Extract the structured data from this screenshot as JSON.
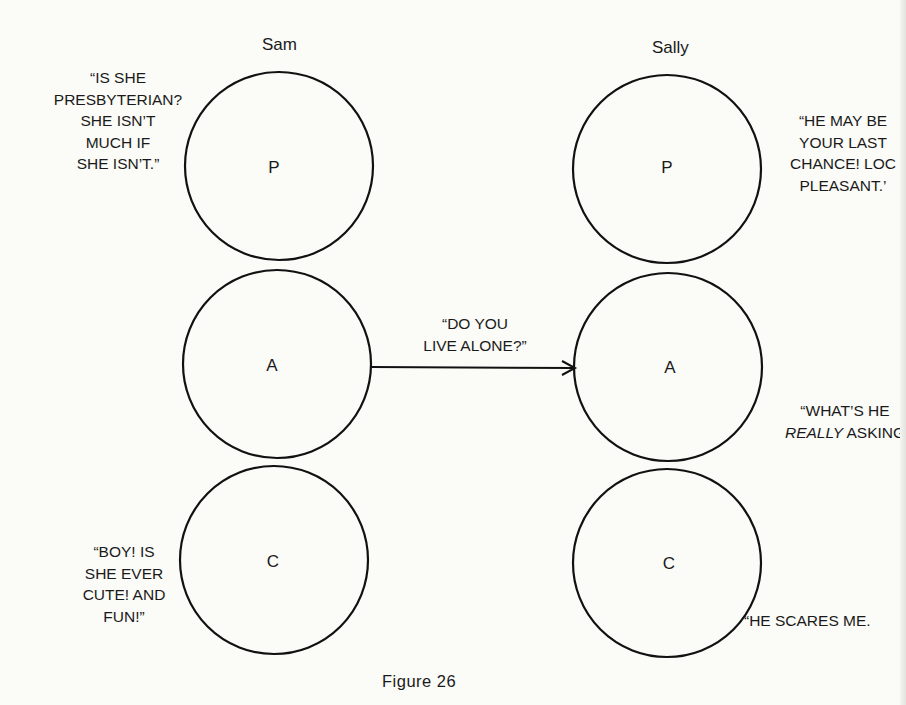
{
  "diagram": {
    "type": "transactional-analysis-ego-state-diagram",
    "caption": "Figure 26",
    "people": [
      {
        "name": "Sam",
        "states": [
          {
            "letter": "P",
            "meaning": "Parent"
          },
          {
            "letter": "A",
            "meaning": "Adult"
          },
          {
            "letter": "C",
            "meaning": "Child"
          }
        ],
        "quotes": {
          "P": [
            "“IS SHE",
            "PRESBYTERIAN?",
            "SHE ISN’T",
            "MUCH IF",
            "SHE ISN’T.”"
          ],
          "C": [
            "“BOY! IS",
            "SHE EVER",
            "CUTE! AND",
            "FUN!”"
          ]
        }
      },
      {
        "name": "Sally",
        "states": [
          {
            "letter": "P",
            "meaning": "Parent"
          },
          {
            "letter": "A",
            "meaning": "Adult"
          },
          {
            "letter": "C",
            "meaning": "Child"
          }
        ],
        "quotes": {
          "P": [
            "“HE MAY BE",
            "YOUR LAST",
            "CHANCE! LOC",
            "PLEASANT.’"
          ],
          "A_line1": "“WHAT’S HE",
          "A_line2_italic": "REALLY",
          "A_line2_rest": " ASKING",
          "C": [
            "“HE SCARES ME."
          ]
        }
      }
    ],
    "transaction": {
      "from": "Sam.A",
      "to": "Sally.A",
      "message": [
        "“DO YOU",
        "LIVE ALONE?”"
      ]
    },
    "colors": {
      "stroke": "#111111",
      "background": "#fbfbf7"
    }
  }
}
